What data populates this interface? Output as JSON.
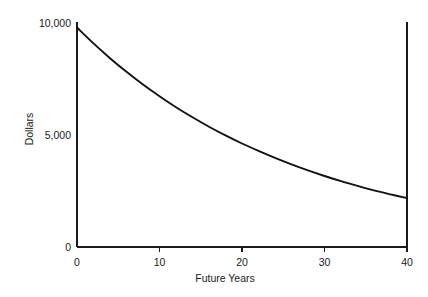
{
  "chart_data": {
    "type": "line",
    "title": "",
    "xlabel": "Future Years",
    "ylabel": "Dollars",
    "xlim": [
      0,
      40
    ],
    "ylim": [
      0,
      10000
    ],
    "grid": false,
    "legend": null,
    "x_ticks": [
      {
        "value": 0,
        "label": "0"
      },
      {
        "value": 10,
        "label": "10"
      },
      {
        "value": 20,
        "label": "20"
      },
      {
        "value": 30,
        "label": "30"
      },
      {
        "value": 40,
        "label": "40"
      }
    ],
    "y_ticks": [
      {
        "value": 0,
        "label": "0"
      },
      {
        "value": 5000,
        "label": "5,000"
      },
      {
        "value": 10000,
        "label": "10,000"
      }
    ],
    "series": [
      {
        "name": "Present Value of $10,000",
        "color": "#111111",
        "x": [
          0,
          2,
          4,
          6,
          8,
          10,
          12,
          14,
          16,
          18,
          20,
          22,
          24,
          26,
          28,
          30,
          32,
          34,
          36,
          38,
          40
        ],
        "values": [
          9800,
          9090,
          8430,
          7820,
          7250,
          6730,
          6240,
          5790,
          5370,
          4980,
          4620,
          4290,
          3980,
          3690,
          3420,
          3170,
          2940,
          2730,
          2530,
          2350,
          2180
        ]
      }
    ],
    "annotations": []
  }
}
